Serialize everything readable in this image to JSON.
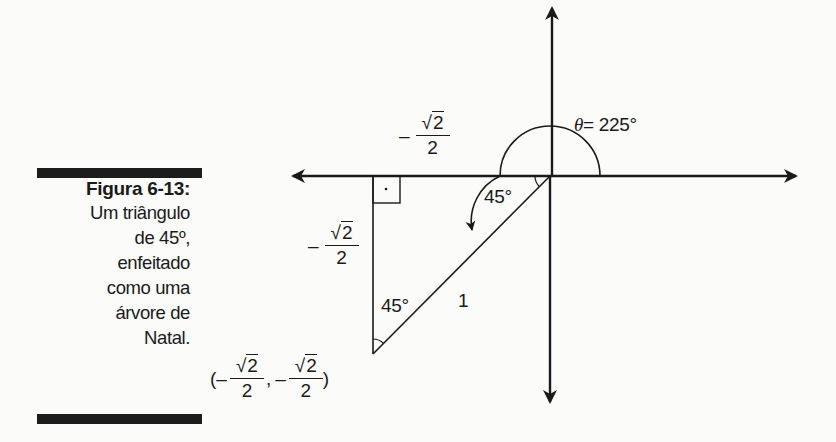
{
  "figure": {
    "label": "Figura 6-13:",
    "caption_lines": [
      "Um triângulo",
      "de 45º,",
      "enfeitado",
      "como uma",
      "árvore de",
      "Natal."
    ]
  },
  "diagram": {
    "theta_symbol": "θ",
    "theta_value": "= 225°",
    "angle_origin_label": "45°",
    "angle_bottom_label": "45°",
    "hypotenuse_label": "1",
    "right_angle_marker": "·",
    "x_leg_label": {
      "sign": "–",
      "numerator": "2",
      "radical": "√",
      "denominator": "2"
    },
    "y_leg_label": {
      "sign": "–",
      "numerator": "2",
      "radical": "√",
      "denominator": "2"
    },
    "point_label": {
      "open": "(",
      "x": {
        "sign": "–",
        "radical": "√",
        "numerator": "2",
        "denominator": "2"
      },
      "separator": ",",
      "y": {
        "sign": "–",
        "radical": "√",
        "numerator": "2",
        "denominator": "2"
      },
      "close": ")"
    }
  },
  "colors": {
    "ink": "#1a1a1a",
    "paper": "#fbfbfa",
    "bar": "#1c1c1c"
  }
}
